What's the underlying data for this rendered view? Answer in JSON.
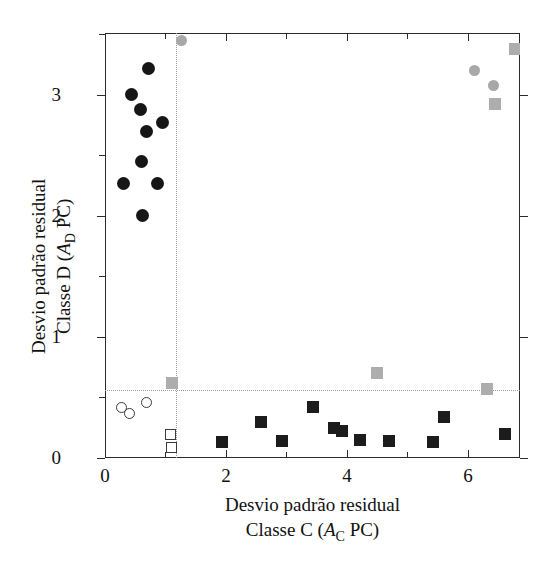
{
  "chart_data": {
    "type": "scatter",
    "title": "",
    "xlabel_line1": "Desvio padrão residual",
    "xlabel_line2_prefix": "Classe C   (",
    "xlabel_line2_var": "A",
    "xlabel_line2_sub": "C",
    "xlabel_line2_suffix": " PC)",
    "ylabel_line1": "Desvio padrão residual",
    "ylabel_line2_prefix": "Classe D  (",
    "ylabel_line2_var": "A",
    "ylabel_line2_sub": "D",
    "ylabel_line2_suffix": " PC)",
    "xlim": [
      0,
      6.86
    ],
    "ylim": [
      0,
      3.51
    ],
    "xticks": [
      0,
      2,
      4,
      6
    ],
    "xtick_labels": [
      "0",
      "2",
      "4",
      "6"
    ],
    "xticks_minor": [
      1,
      3,
      5
    ],
    "yticks": [
      0,
      1,
      2,
      3
    ],
    "ytick_labels": [
      "0",
      "1",
      "2",
      "3"
    ],
    "yticks_minor": [
      0.5,
      1.5,
      2.5,
      3.5
    ],
    "grid": false,
    "legend": "none",
    "reference_lines": {
      "vertical_x": 1.17,
      "horizontal_y": 0.56,
      "style": "dotted",
      "color": "#9a9a9a"
    },
    "series": [
      {
        "name": "Classe D - treino (círculo preenchido)",
        "marker": "circle-filled",
        "color": "#161616",
        "points": [
          [
            0.72,
            3.22
          ],
          [
            0.44,
            3.0
          ],
          [
            0.58,
            2.88
          ],
          [
            0.95,
            2.77
          ],
          [
            0.68,
            2.7
          ],
          [
            0.6,
            2.45
          ],
          [
            0.31,
            2.27
          ],
          [
            0.87,
            2.27
          ],
          [
            0.62,
            2.0
          ]
        ]
      },
      {
        "name": "Classe D - outliers (círculo cinza)",
        "marker": "circle-gray",
        "color": "#a8a8a8",
        "points": [
          [
            1.26,
            3.45
          ],
          [
            6.1,
            3.2
          ],
          [
            6.42,
            3.08
          ]
        ]
      },
      {
        "name": "Classe C - amostras (quadrado preenchido)",
        "marker": "square-filled",
        "color": "#1c1c1c",
        "points": [
          [
            1.94,
            0.13
          ],
          [
            2.58,
            0.3
          ],
          [
            2.93,
            0.14
          ],
          [
            3.44,
            0.42
          ],
          [
            3.78,
            0.25
          ],
          [
            3.92,
            0.22
          ],
          [
            4.22,
            0.15
          ],
          [
            4.7,
            0.14
          ],
          [
            5.42,
            0.13
          ],
          [
            5.6,
            0.34
          ],
          [
            6.62,
            0.2
          ]
        ]
      },
      {
        "name": "Classe C - cinza (quadrado cinza)",
        "marker": "square-gray",
        "color": "#adadad",
        "points": [
          [
            1.1,
            0.62
          ],
          [
            4.5,
            0.7
          ],
          [
            6.32,
            0.57
          ],
          [
            6.45,
            2.92
          ],
          [
            6.78,
            3.38
          ]
        ]
      },
      {
        "name": "Classe D - baixo (círculo vazado)",
        "marker": "circle-open",
        "color": "#3a3a3a",
        "points": [
          [
            0.28,
            0.42
          ],
          [
            0.41,
            0.37
          ],
          [
            0.68,
            0.46
          ]
        ]
      },
      {
        "name": "Classe C - baixo (quadrado vazado)",
        "marker": "square-open",
        "color": "#3a3a3a",
        "points": [
          [
            1.08,
            0.19
          ],
          [
            1.1,
            0.09
          ]
        ]
      }
    ]
  }
}
